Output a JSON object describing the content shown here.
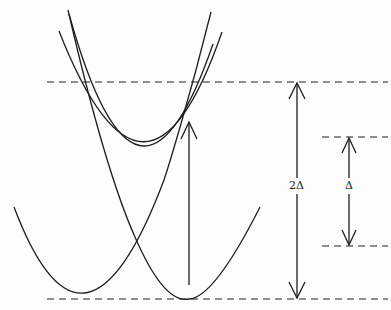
{
  "diagram": {
    "type": "potential-energy-curves",
    "stroke_color": "#1e1e1e",
    "background": "#fdfdfb",
    "levels": {
      "upper": {
        "y": 82
      },
      "middle_right": {
        "y": 137
      },
      "lower_right": {
        "y": 246
      },
      "bottom": {
        "y": 299
      }
    },
    "labels": {
      "two_delta": "2Δ",
      "delta": "Δ"
    },
    "arrows": [
      {
        "name": "excitation-arrow",
        "direction": "up"
      },
      {
        "name": "two-delta-arrow",
        "direction": "both",
        "label": "2Δ"
      },
      {
        "name": "delta-arrow",
        "direction": "both",
        "label": "Δ"
      }
    ],
    "curves": [
      {
        "name": "lower-left-parabola",
        "minimum": [
          84,
          299
        ]
      },
      {
        "name": "lower-right-parabola",
        "minimum": [
          189,
          299
        ]
      },
      {
        "name": "upper-parabola-a",
        "minimum": [
          138,
          137
        ]
      },
      {
        "name": "upper-parabola-b",
        "minimum": [
          150,
          140
        ]
      }
    ]
  }
}
